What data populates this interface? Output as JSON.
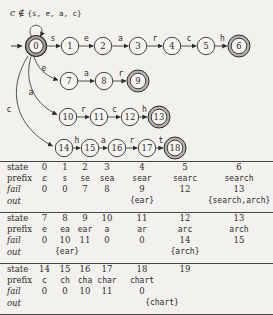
{
  "caption": {
    "parts": [
      {
        "text": "c",
        "style": "italic"
      },
      {
        "text": " ∉ ",
        "style": "roman"
      },
      {
        "text": "{s, e, a, c}",
        "style": "mono"
      }
    ]
  },
  "colors": {
    "ink": "#2e2c29",
    "bg_fill": "#f5f4f2",
    "final_ring": "#b4b1ac",
    "start_ring": "#a7a4a0",
    "rule": "#49453f"
  },
  "automaton": {
    "states": [
      {
        "id": "0",
        "x": 36,
        "y": 46,
        "kind": "start"
      },
      {
        "id": "1",
        "x": 70,
        "y": 46,
        "kind": "normal"
      },
      {
        "id": "2",
        "x": 103,
        "y": 46,
        "kind": "normal"
      },
      {
        "id": "3",
        "x": 138,
        "y": 46,
        "kind": "normal"
      },
      {
        "id": "4",
        "x": 172,
        "y": 46,
        "kind": "normal"
      },
      {
        "id": "5",
        "x": 206,
        "y": 46,
        "kind": "normal"
      },
      {
        "id": "6",
        "x": 239,
        "y": 46,
        "kind": "final"
      },
      {
        "id": "7",
        "x": 69,
        "y": 81,
        "kind": "normal"
      },
      {
        "id": "8",
        "x": 104,
        "y": 81,
        "kind": "normal"
      },
      {
        "id": "9",
        "x": 138,
        "y": 81,
        "kind": "final"
      },
      {
        "id": "10",
        "x": 68,
        "y": 117,
        "kind": "normal"
      },
      {
        "id": "11",
        "x": 99,
        "y": 117,
        "kind": "normal"
      },
      {
        "id": "12",
        "x": 130,
        "y": 117,
        "kind": "normal"
      },
      {
        "id": "13",
        "x": 159,
        "y": 117,
        "kind": "final"
      },
      {
        "id": "14",
        "x": 64,
        "y": 148,
        "kind": "normal"
      },
      {
        "id": "15",
        "x": 90,
        "y": 148,
        "kind": "normal"
      },
      {
        "id": "16",
        "x": 117,
        "y": 148,
        "kind": "normal"
      },
      {
        "id": "17",
        "x": 147,
        "y": 148,
        "kind": "normal"
      },
      {
        "id": "18",
        "x": 175,
        "y": 148,
        "kind": "final"
      }
    ],
    "edges": [
      {
        "from": "0",
        "to": "1",
        "label": "s"
      },
      {
        "from": "1",
        "to": "2",
        "label": "e"
      },
      {
        "from": "2",
        "to": "3",
        "label": "a"
      },
      {
        "from": "3",
        "to": "4",
        "label": "r"
      },
      {
        "from": "4",
        "to": "5",
        "label": "c"
      },
      {
        "from": "5",
        "to": "6",
        "label": "h"
      },
      {
        "from": "7",
        "to": "8",
        "label": "a"
      },
      {
        "from": "8",
        "to": "9",
        "label": "r"
      },
      {
        "from": "10",
        "to": "11",
        "label": "r"
      },
      {
        "from": "11",
        "to": "12",
        "label": "c"
      },
      {
        "from": "12",
        "to": "13",
        "label": "h"
      },
      {
        "from": "14",
        "to": "15",
        "label": "h"
      },
      {
        "from": "15",
        "to": "16",
        "label": "a"
      },
      {
        "from": "16",
        "to": "17",
        "label": "r"
      },
      {
        "from": "17",
        "to": "18",
        "label": "t"
      },
      {
        "from": "0",
        "to": "7",
        "label": "e",
        "path": "M 34,57 C 38,69 46,76 58,80",
        "labelPos": [
          44,
          71
        ]
      },
      {
        "from": "0",
        "to": "10",
        "label": "a",
        "path": "M 31,56.5 C 23,83 36,105 57,114.5",
        "labelPos": [
          31,
          95
        ]
      },
      {
        "from": "0",
        "to": "14",
        "label": "c",
        "path": "M 28,56 C 7,89 14,126 52.5,146",
        "labelPos": [
          9,
          112
        ]
      }
    ],
    "self_loop": {
      "path": "M 31.5,36.5 C 24,21.5 48,21.5 40.5,36.5"
    },
    "start_arrow": {
      "path": "M 11,46 L 22,46"
    }
  },
  "table": {
    "row_labels": {
      "state": "state",
      "prefix": "prefix",
      "fail": "fail",
      "out": "out"
    },
    "sections": [
      {
        "state": [
          "0",
          "1",
          "2",
          "3",
          "4",
          "5",
          "6"
        ],
        "prefix": [
          "ε",
          "s",
          "se",
          "sea",
          "sear",
          "searc",
          "search"
        ],
        "fail": [
          "0",
          "0",
          "7",
          "8",
          "9",
          "12",
          "13"
        ],
        "out": [
          {
            "col": 4,
            "text": "{ear}"
          },
          {
            "col": 6,
            "text": "{search,arch}"
          }
        ]
      },
      {
        "state": [
          "7",
          "8",
          "9",
          "10",
          "11",
          "12",
          "13"
        ],
        "prefix": [
          "e",
          "ea",
          "ear",
          "a",
          "ar",
          "arc",
          "arch"
        ],
        "fail": [
          "0",
          "10",
          "11",
          "0",
          "0",
          "14",
          "15"
        ],
        "out": [
          {
            "col": 1,
            "text": "{ear}"
          },
          {
            "col": 5,
            "text": "{arch}"
          }
        ]
      },
      {
        "state": [
          "14",
          "15",
          "16",
          "17",
          "18",
          "19"
        ],
        "prefix": [
          "c",
          "ch",
          "cha",
          "char",
          "chart"
        ],
        "fail": [
          "0",
          "0",
          "10",
          "11",
          "0"
        ],
        "out": [
          {
            "col": 4,
            "span": 2,
            "text": "{chart}"
          }
        ]
      }
    ]
  }
}
